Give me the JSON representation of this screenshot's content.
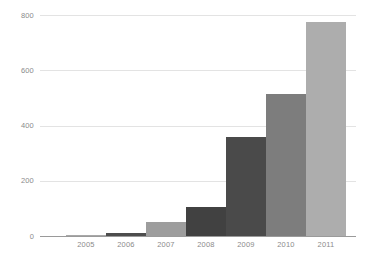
{
  "chart_data": {
    "type": "bar",
    "title": "",
    "subtitle": "",
    "xlabel": "",
    "ylabel": "",
    "categories": [
      "2005",
      "2006",
      "2007",
      "2008",
      "2009",
      "2010",
      "2011"
    ],
    "values": [
      3,
      12,
      50,
      103,
      352,
      503,
      757
    ],
    "series": [
      {
        "name": "",
        "values": [
          3,
          12,
          50,
          103,
          352,
          503,
          757
        ]
      }
    ],
    "ylim": [
      0,
      800
    ],
    "yticks": [
      0,
      200,
      400,
      600,
      800
    ],
    "ytick_labels": [
      "0",
      "200",
      "400",
      "600",
      "800"
    ],
    "grid": true,
    "legend": false,
    "legend_position": "none",
    "bar_colors": [
      "#a8a8a8",
      "#4d4d4d",
      "#9d9d9d",
      "#414141",
      "#4a4a4a",
      "#7d7d7d",
      "#adadad"
    ],
    "axis_color": "#9a9a9a",
    "gridline_color": "#e3e3e3",
    "tick_label_color": "#8b8b8b",
    "background_color": "#ffffff"
  }
}
